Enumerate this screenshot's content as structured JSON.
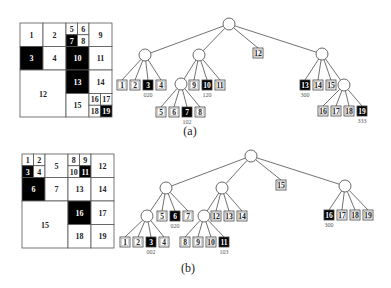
{
  "figure": {
    "a": {
      "caption": "(a)",
      "grid": {
        "cells": [
          {
            "id": "1",
            "x": 20,
            "y": 23,
            "w": 23,
            "h": 23.5,
            "filled": false
          },
          {
            "id": "2",
            "x": 43,
            "y": 23,
            "w": 23,
            "h": 23.5,
            "filled": false
          },
          {
            "id": "5",
            "x": 66,
            "y": 23,
            "w": 11.5,
            "h": 11.75,
            "filled": false
          },
          {
            "id": "6",
            "x": 77.5,
            "y": 23,
            "w": 11.5,
            "h": 11.75,
            "filled": false
          },
          {
            "id": "7",
            "x": 66,
            "y": 34.75,
            "w": 11.5,
            "h": 11.75,
            "filled": true
          },
          {
            "id": "8",
            "x": 77.5,
            "y": 34.75,
            "w": 11.5,
            "h": 11.75,
            "filled": false
          },
          {
            "id": "9",
            "x": 89,
            "y": 23,
            "w": 23,
            "h": 23.5,
            "filled": false
          },
          {
            "id": "3",
            "x": 20,
            "y": 46.5,
            "w": 23,
            "h": 23.5,
            "filled": true
          },
          {
            "id": "4",
            "x": 43,
            "y": 46.5,
            "w": 23,
            "h": 23.5,
            "filled": false
          },
          {
            "id": "10",
            "x": 66,
            "y": 46.5,
            "w": 23,
            "h": 23.5,
            "filled": true
          },
          {
            "id": "11",
            "x": 89,
            "y": 46.5,
            "w": 23,
            "h": 23.5,
            "filled": false
          },
          {
            "id": "12",
            "x": 20,
            "y": 70,
            "w": 46,
            "h": 47,
            "filled": false
          },
          {
            "id": "13",
            "x": 66,
            "y": 70,
            "w": 23,
            "h": 23.5,
            "filled": true
          },
          {
            "id": "14",
            "x": 89,
            "y": 70,
            "w": 23,
            "h": 23.5,
            "filled": false
          },
          {
            "id": "15",
            "x": 66,
            "y": 93.5,
            "w": 23,
            "h": 23.5,
            "filled": false
          },
          {
            "id": "16",
            "x": 89,
            "y": 93.5,
            "w": 11.5,
            "h": 11.75,
            "filled": false
          },
          {
            "id": "17",
            "x": 100.5,
            "y": 93.5,
            "w": 11.5,
            "h": 11.75,
            "filled": false
          },
          {
            "id": "18",
            "x": 89,
            "y": 105.25,
            "w": 11.5,
            "h": 11.75,
            "filled": false
          },
          {
            "id": "19",
            "x": 100.5,
            "y": 105.25,
            "w": 11.5,
            "h": 11.75,
            "filled": true
          }
        ]
      },
      "tree": {
        "internal_nodes": [
          {
            "name": "root",
            "cx": 229,
            "cy": 24
          },
          {
            "name": "q0",
            "cx": 145,
            "cy": 55
          },
          {
            "name": "q1",
            "cx": 199,
            "cy": 55
          },
          {
            "name": "q3",
            "cx": 322,
            "cy": 54
          },
          {
            "name": "q1-0",
            "cx": 181,
            "cy": 84
          },
          {
            "name": "q3-3",
            "cx": 344,
            "cy": 85
          }
        ],
        "edges": [
          [
            "root",
            "q0"
          ],
          [
            "root",
            "q1"
          ],
          [
            "root",
            "leaf-12"
          ],
          [
            "root",
            "q3"
          ],
          [
            "q0",
            "leaf-1"
          ],
          [
            "q0",
            "leaf-2"
          ],
          [
            "q0",
            "leaf-3"
          ],
          [
            "q0",
            "leaf-4"
          ],
          [
            "q1",
            "q1-0"
          ],
          [
            "q1",
            "leaf-9"
          ],
          [
            "q1",
            "leaf-10"
          ],
          [
            "q1",
            "leaf-11"
          ],
          [
            "q1-0",
            "leaf-5"
          ],
          [
            "q1-0",
            "leaf-6"
          ],
          [
            "q1-0",
            "leaf-7"
          ],
          [
            "q1-0",
            "leaf-8"
          ],
          [
            "q3",
            "leaf-13"
          ],
          [
            "q3",
            "leaf-14"
          ],
          [
            "q3",
            "leaf-15"
          ],
          [
            "q3",
            "q3-3"
          ],
          [
            "q3-3",
            "leaf-16"
          ],
          [
            "q3-3",
            "leaf-17"
          ],
          [
            "q3-3",
            "leaf-18"
          ],
          [
            "q3-3",
            "leaf-19"
          ]
        ],
        "leaves": [
          {
            "id": "1",
            "x": 117,
            "y": 80,
            "filled": false
          },
          {
            "id": "2",
            "x": 130,
            "y": 80,
            "filled": false
          },
          {
            "id": "3",
            "x": 143,
            "y": 80,
            "filled": true,
            "code": "020"
          },
          {
            "id": "4",
            "x": 156,
            "y": 80,
            "filled": false
          },
          {
            "id": "9",
            "x": 189,
            "y": 80,
            "filled": false
          },
          {
            "id": "10",
            "x": 202,
            "y": 80,
            "filled": true,
            "code": "120"
          },
          {
            "id": "11",
            "x": 215,
            "y": 80,
            "filled": false
          },
          {
            "id": "5",
            "x": 156,
            "y": 107,
            "filled": false
          },
          {
            "id": "6",
            "x": 169,
            "y": 107,
            "filled": false
          },
          {
            "id": "7",
            "x": 182,
            "y": 107,
            "filled": true,
            "code": "102"
          },
          {
            "id": "8",
            "x": 195,
            "y": 107,
            "filled": false
          },
          {
            "id": "12",
            "x": 253,
            "y": 48,
            "filled": false
          },
          {
            "id": "13",
            "x": 300,
            "y": 80,
            "filled": true,
            "code": "300"
          },
          {
            "id": "14",
            "x": 313,
            "y": 80,
            "filled": false
          },
          {
            "id": "15",
            "x": 326,
            "y": 80,
            "filled": false
          },
          {
            "id": "16",
            "x": 318,
            "y": 106,
            "filled": false
          },
          {
            "id": "17",
            "x": 331,
            "y": 106,
            "filled": false
          },
          {
            "id": "18",
            "x": 344,
            "y": 106,
            "filled": false
          },
          {
            "id": "19",
            "x": 357,
            "y": 106,
            "filled": true,
            "code": "333"
          }
        ]
      }
    },
    "b": {
      "caption": "(b)",
      "grid": {
        "cells": [
          {
            "id": "1",
            "x": 22,
            "y": 154,
            "w": 11.5,
            "h": 11.75,
            "filled": false
          },
          {
            "id": "2",
            "x": 33.5,
            "y": 154,
            "w": 11.5,
            "h": 11.75,
            "filled": false
          },
          {
            "id": "3",
            "x": 22,
            "y": 165.75,
            "w": 11.5,
            "h": 11.75,
            "filled": true
          },
          {
            "id": "4",
            "x": 33.5,
            "y": 165.75,
            "w": 11.5,
            "h": 11.75,
            "filled": false
          },
          {
            "id": "5",
            "x": 45,
            "y": 154,
            "w": 23,
            "h": 23.5,
            "filled": false
          },
          {
            "id": "8",
            "x": 68,
            "y": 154,
            "w": 11.5,
            "h": 11.75,
            "filled": false
          },
          {
            "id": "9",
            "x": 79.5,
            "y": 154,
            "w": 11.5,
            "h": 11.75,
            "filled": false
          },
          {
            "id": "10",
            "x": 68,
            "y": 165.75,
            "w": 11.5,
            "h": 11.75,
            "filled": false
          },
          {
            "id": "11",
            "x": 79.5,
            "y": 165.75,
            "w": 11.5,
            "h": 11.75,
            "filled": true
          },
          {
            "id": "12",
            "x": 91,
            "y": 154,
            "w": 23,
            "h": 23.5,
            "filled": false
          },
          {
            "id": "6",
            "x": 22,
            "y": 177.5,
            "w": 23,
            "h": 23.5,
            "filled": true
          },
          {
            "id": "7",
            "x": 45,
            "y": 177.5,
            "w": 23,
            "h": 23.5,
            "filled": false
          },
          {
            "id": "13",
            "x": 68,
            "y": 177.5,
            "w": 23,
            "h": 23.5,
            "filled": false
          },
          {
            "id": "14",
            "x": 91,
            "y": 177.5,
            "w": 23,
            "h": 23.5,
            "filled": false
          },
          {
            "id": "15",
            "x": 22,
            "y": 201,
            "w": 46,
            "h": 47,
            "filled": false
          },
          {
            "id": "16",
            "x": 68,
            "y": 201,
            "w": 23,
            "h": 23.5,
            "filled": true
          },
          {
            "id": "17",
            "x": 91,
            "y": 201,
            "w": 23,
            "h": 23.5,
            "filled": false
          },
          {
            "id": "18",
            "x": 68,
            "y": 224.5,
            "w": 23,
            "h": 23.5,
            "filled": false
          },
          {
            "id": "19",
            "x": 91,
            "y": 224.5,
            "w": 23,
            "h": 23.5,
            "filled": false
          }
        ]
      },
      "tree": {
        "internal_nodes": [
          {
            "name": "root",
            "cx": 251,
            "cy": 156
          },
          {
            "name": "q0",
            "cx": 166,
            "cy": 188
          },
          {
            "name": "q1",
            "cx": 222,
            "cy": 188
          },
          {
            "name": "q3",
            "cx": 345,
            "cy": 186
          },
          {
            "name": "q0-0",
            "cx": 147,
            "cy": 216
          },
          {
            "name": "q1-0",
            "cx": 204,
            "cy": 216
          }
        ],
        "edges": [
          [
            "root",
            "q0"
          ],
          [
            "root",
            "q1"
          ],
          [
            "root",
            "leaf-15"
          ],
          [
            "root",
            "q3"
          ],
          [
            "q0",
            "q0-0"
          ],
          [
            "q0",
            "leaf-5"
          ],
          [
            "q0",
            "leaf-6"
          ],
          [
            "q0",
            "leaf-7"
          ],
          [
            "q0-0",
            "leaf-1"
          ],
          [
            "q0-0",
            "leaf-2"
          ],
          [
            "q0-0",
            "leaf-3"
          ],
          [
            "q0-0",
            "leaf-4"
          ],
          [
            "q1",
            "q1-0"
          ],
          [
            "q1",
            "leaf-12"
          ],
          [
            "q1",
            "leaf-13"
          ],
          [
            "q1",
            "leaf-14"
          ],
          [
            "q1-0",
            "leaf-8"
          ],
          [
            "q1-0",
            "leaf-9"
          ],
          [
            "q1-0",
            "leaf-10"
          ],
          [
            "q1-0",
            "leaf-11"
          ],
          [
            "q3",
            "leaf-16"
          ],
          [
            "q3",
            "leaf-17"
          ],
          [
            "q3",
            "leaf-18"
          ],
          [
            "q3",
            "leaf-19"
          ]
        ],
        "leaves": [
          {
            "id": "1",
            "x": 120,
            "y": 237,
            "filled": false
          },
          {
            "id": "2",
            "x": 133,
            "y": 237,
            "filled": false
          },
          {
            "id": "3",
            "x": 146,
            "y": 237,
            "filled": true,
            "code": "002"
          },
          {
            "id": "4",
            "x": 159,
            "y": 237,
            "filled": false
          },
          {
            "id": "5",
            "x": 157,
            "y": 211,
            "filled": false
          },
          {
            "id": "6",
            "x": 170,
            "y": 211,
            "filled": true,
            "code": "020"
          },
          {
            "id": "7",
            "x": 183,
            "y": 211,
            "filled": false
          },
          {
            "id": "8",
            "x": 180,
            "y": 237,
            "filled": false
          },
          {
            "id": "9",
            "x": 193,
            "y": 237,
            "filled": false
          },
          {
            "id": "10",
            "x": 206,
            "y": 237,
            "filled": false
          },
          {
            "id": "11",
            "x": 219,
            "y": 237,
            "filled": true,
            "code": "103"
          },
          {
            "id": "12",
            "x": 211,
            "y": 211,
            "filled": false
          },
          {
            "id": "13",
            "x": 224,
            "y": 211,
            "filled": false
          },
          {
            "id": "14",
            "x": 237,
            "y": 211,
            "filled": false
          },
          {
            "id": "15",
            "x": 276,
            "y": 180,
            "filled": false
          },
          {
            "id": "16",
            "x": 324,
            "y": 210,
            "filled": true,
            "code": "300"
          },
          {
            "id": "17",
            "x": 337,
            "y": 210,
            "filled": false
          },
          {
            "id": "18",
            "x": 350,
            "y": 210,
            "filled": false
          },
          {
            "id": "19",
            "x": 363,
            "y": 210,
            "filled": false
          }
        ]
      }
    },
    "layout": {
      "leaf_size": 10,
      "node_radius": 6,
      "captions": [
        {
          "text": "(a)",
          "x": 190,
          "y": 131
        },
        {
          "text": "(b)",
          "x": 188,
          "y": 268
        }
      ],
      "colors": {
        "filled": "#000000",
        "empty": "#ffffff",
        "stroke": "#444444",
        "code_text": "#555555"
      }
    }
  }
}
